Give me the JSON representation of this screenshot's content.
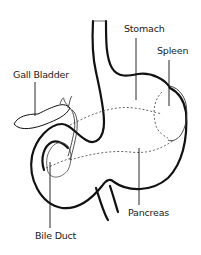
{
  "diagram": {
    "labels": {
      "stomach": "Stomach",
      "spleen": "Spleen",
      "gall_bladder": "Gall Bladder",
      "pancreas": "Pancreas",
      "bile_duct": "Bile Duct"
    },
    "colors": {
      "background": "#ffffff",
      "outline": "#111111",
      "fine_line": "#444444",
      "dotted_line": "#555555"
    }
  }
}
